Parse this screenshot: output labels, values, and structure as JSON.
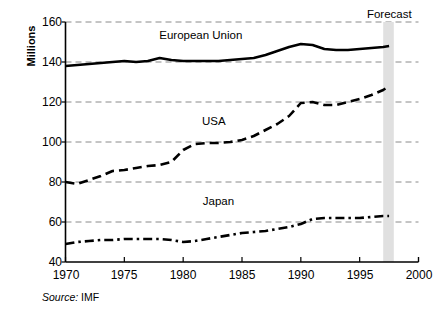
{
  "chart_data": {
    "type": "line",
    "title": "",
    "xlabel": "",
    "ylabel": "Millions",
    "xlim": [
      1970,
      2000
    ],
    "ylim": [
      40,
      160
    ],
    "ytick_values": [
      40,
      60,
      80,
      100,
      120,
      140,
      160
    ],
    "ytick_labels": [
      "40",
      "60",
      "80",
      "100",
      "120",
      "140",
      "160"
    ],
    "xtick_values": [
      1970,
      1975,
      1980,
      1985,
      1990,
      1995,
      2000
    ],
    "xtick_labels": [
      "1970",
      "1975",
      "1980",
      "1985",
      "1990",
      "1995",
      "2000"
    ],
    "grid": "horizontal-dashed",
    "legend_position": "inline-annotations",
    "x": [
      1970,
      1971,
      1972,
      1973,
      1974,
      1975,
      1976,
      1977,
      1978,
      1979,
      1980,
      1981,
      1982,
      1983,
      1984,
      1985,
      1986,
      1987,
      1988,
      1989,
      1990,
      1991,
      1992,
      1993,
      1994,
      1995,
      1996,
      1997,
      1997.5
    ],
    "series": [
      {
        "name": "European Union",
        "style": "solid",
        "color": "#000000",
        "values": [
          138,
          138.5,
          139,
          139.5,
          140,
          140.5,
          140,
          140.5,
          142,
          141,
          140.5,
          140.5,
          140.5,
          140.5,
          141,
          141.5,
          142,
          143.5,
          145.5,
          147.5,
          149,
          148.5,
          146.5,
          146,
          146,
          146.5,
          147,
          147.5,
          148
        ]
      },
      {
        "name": "USA",
        "style": "dashed",
        "color": "#000000",
        "values": [
          80,
          79,
          81,
          83,
          85.5,
          86,
          87,
          88,
          88.5,
          90,
          96,
          99,
          99.5,
          99.5,
          100,
          101,
          103,
          106,
          109,
          113,
          119.5,
          120,
          118.5,
          118.5,
          120,
          121.5,
          123.5,
          126,
          128
        ]
      },
      {
        "name": "Japan",
        "style": "dash-dot",
        "color": "#000000",
        "values": [
          49,
          50,
          50.5,
          51,
          51,
          51.5,
          51.5,
          51.5,
          51.5,
          51,
          50,
          50.5,
          51.5,
          52.5,
          53.5,
          54.5,
          55,
          55.5,
          56.5,
          57.5,
          59,
          61.5,
          62,
          62,
          62,
          62,
          62.5,
          63,
          63
        ]
      }
    ],
    "annotations": [
      {
        "text": "European Union",
        "x": 1981.5,
        "y": 153
      },
      {
        "text": "USA",
        "x": 1982.6,
        "y": 110
      },
      {
        "text": "Japan",
        "x": 1983.0,
        "y": 70
      },
      {
        "text": "Forecast",
        "x": 1997.6,
        "y": 162
      }
    ],
    "forecast_band": {
      "label": "Forecast",
      "start": 1997.0,
      "end": 1997.9,
      "color": "#e0e0e0"
    },
    "source": {
      "prefix": "Source:",
      "value": "IMF"
    }
  }
}
